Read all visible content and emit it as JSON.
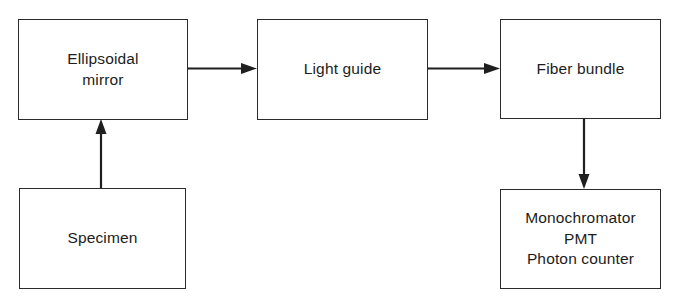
{
  "diagram": {
    "background_color": "#ffffff",
    "line_color": "#1f1f1f",
    "box_border_color": "#2b2b2b",
    "nodes": [
      {
        "id": "ellipsoidal-mirror",
        "label": "Ellipsoidal\nmirror"
      },
      {
        "id": "light-guide",
        "label": "Light guide"
      },
      {
        "id": "fiber-bundle",
        "label": "Fiber bundle"
      },
      {
        "id": "specimen",
        "label": "Specimen"
      },
      {
        "id": "detector",
        "label": "Monochromator\nPMT\nPhoton counter"
      }
    ],
    "connectors": [
      {
        "id": "specimen-to-mirror",
        "from": "specimen",
        "to": "ellipsoidal-mirror",
        "direction": "up"
      },
      {
        "id": "mirror-to-light-guide",
        "from": "ellipsoidal-mirror",
        "to": "light-guide",
        "direction": "right"
      },
      {
        "id": "light-guide-to-fiber",
        "from": "light-guide",
        "to": "fiber-bundle",
        "direction": "right"
      },
      {
        "id": "fiber-to-detector",
        "from": "fiber-bundle",
        "to": "detector",
        "direction": "down"
      }
    ]
  }
}
